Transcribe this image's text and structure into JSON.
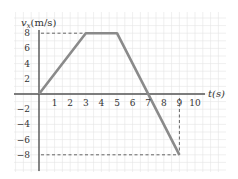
{
  "chart_data": {
    "type": "line",
    "title": "",
    "xlabel": "t(s)",
    "ylabel": "v_x(m/s)",
    "ylabel_base": "v",
    "ylabel_sub": "x",
    "ylabel_unit": "(m/s)",
    "xlim": [
      0,
      10
    ],
    "ylim": [
      -8,
      8
    ],
    "grid": true,
    "x_ticks": [
      "1",
      "2",
      "3",
      "4",
      "5",
      "6",
      "7",
      "8",
      "9",
      "10"
    ],
    "y_ticks_pos": [
      "8",
      "6",
      "4",
      "2"
    ],
    "y_ticks_neg": [
      "−2",
      "−4",
      "−6",
      "−8"
    ],
    "series": [
      {
        "name": "v_x(t)",
        "x": [
          0,
          3,
          5,
          9
        ],
        "y": [
          0,
          8,
          8,
          -8
        ],
        "color": "#8a8a8a"
      }
    ],
    "reference_lines": [
      {
        "type": "horizontal-dashed",
        "y": 8,
        "x_from": 0,
        "x_to": 3
      },
      {
        "type": "horizontal-dashed",
        "y": -8,
        "x_from": 0,
        "x_to": 9
      },
      {
        "type": "vertical-dashed",
        "x": 9,
        "y_from": 0,
        "y_to": -8
      }
    ]
  },
  "colors": {
    "grid_minor": "#e4e4e4",
    "grid_major": "#d0d0d0",
    "axis": "#555555",
    "curve": "#8a8a8a",
    "dashed": "#555555"
  }
}
